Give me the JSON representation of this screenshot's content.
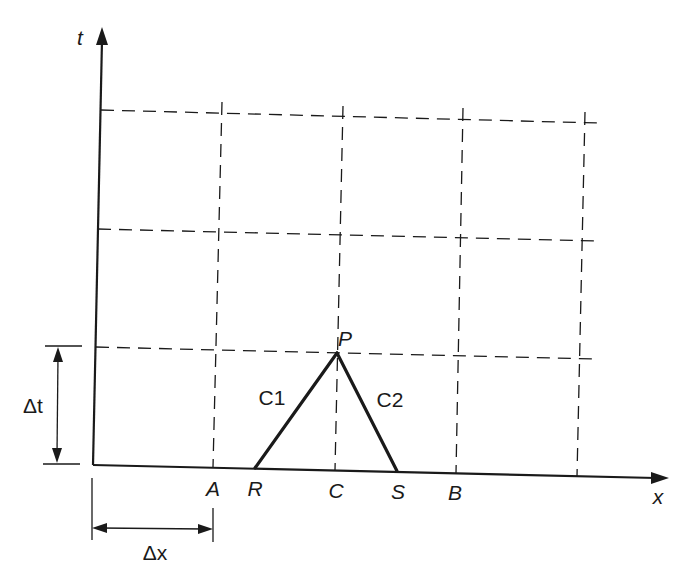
{
  "figure": {
    "type": "characteristic-grid-diagram"
  },
  "axes": {
    "x_label": "x",
    "t_label": "t"
  },
  "points": {
    "A": "A",
    "R": "R",
    "C": "C",
    "S": "S",
    "B": "B",
    "P": "P"
  },
  "characteristics": {
    "c1": "C1",
    "c2": "C2"
  },
  "dimensions": {
    "dt": "Δt",
    "dx": "Δx"
  },
  "grid": {
    "columns": 4,
    "rows": 3,
    "line_style": "dashed"
  },
  "colors": {
    "ink": "#1a1a1a",
    "background": "#ffffff"
  }
}
